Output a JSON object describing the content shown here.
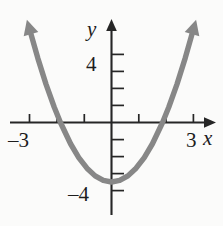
{
  "figure": {
    "name": "parabola-graph",
    "background_color": "#fbfbfa",
    "axis_color": "#262626",
    "curve_color": "#878787"
  },
  "labels": {
    "y_axis": "y",
    "x_axis": "x",
    "y_tick_positive": "4",
    "y_tick_negative": "–4",
    "x_tick_negative": "–3",
    "x_tick_positive": "3"
  },
  "chart_data": {
    "type": "line",
    "title": "",
    "subtitle": "",
    "xlabel": "x",
    "ylabel": "y",
    "xlim": [
      -3.8,
      3.8
    ],
    "ylim": [
      -5.2,
      5.6
    ],
    "grid": false,
    "legend": null,
    "x_ticks": [
      -3,
      -2,
      -1,
      0,
      1,
      2,
      3
    ],
    "x_tick_labels": [
      "–3",
      "",
      "",
      "",
      "",
      "",
      "3"
    ],
    "y_ticks": [
      -4,
      -3,
      -2,
      -1,
      0,
      1,
      2,
      3,
      4
    ],
    "y_tick_labels": [
      "–4",
      "",
      "",
      "",
      "",
      "",
      "",
      "",
      "4"
    ],
    "series": [
      {
        "name": "parabola",
        "equation": "y = x^2 - 3.5",
        "vertex": [
          0,
          -3.5
        ],
        "x_intercepts": [
          -1.87,
          1.87
        ],
        "y_intercept": -3.5,
        "opens": "up",
        "arrowheads": [
          "left-arm-up",
          "right-arm-up"
        ],
        "x": [
          -2.95,
          -2.7,
          -2.4,
          -2.1,
          -1.87,
          -1.5,
          -1.2,
          -0.9,
          -0.6,
          -0.3,
          0,
          0.3,
          0.6,
          0.9,
          1.2,
          1.5,
          1.87,
          2.1,
          2.4,
          2.7,
          2.95
        ],
        "values": [
          5.2,
          3.79,
          2.26,
          0.91,
          0,
          -1.25,
          -2.06,
          -2.69,
          -3.14,
          -3.41,
          -3.5,
          -3.41,
          -3.14,
          -2.69,
          -2.06,
          -1.25,
          0,
          0.91,
          2.26,
          3.79,
          5.2
        ]
      }
    ]
  }
}
